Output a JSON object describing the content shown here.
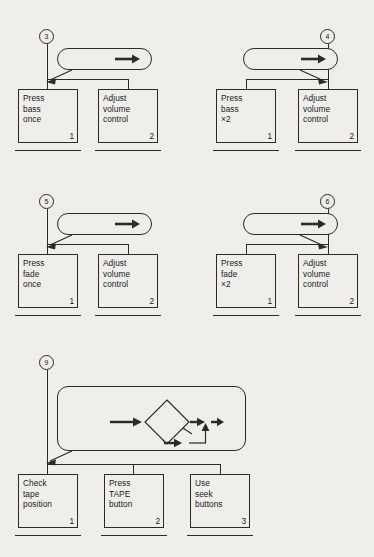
{
  "figure": {
    "notation": "Hierarchical Task Analysis",
    "background_color": "#efeeea",
    "ink_color": "#2a2a2a"
  },
  "diagrams": [
    {
      "id": "diagram-3",
      "marker": "3",
      "plan": {
        "label": "Plan 5.2: 1",
        "arrow": "▶",
        "target": "2"
      },
      "tasks": [
        {
          "text": "Press\nbass\nonce",
          "number": "1"
        },
        {
          "text": "Adjust\nvolume\ncontrol",
          "number": "2"
        }
      ]
    },
    {
      "id": "diagram-4",
      "marker": "4",
      "plan": {
        "label": "Plan 5.3: 1",
        "arrow": "▶",
        "target": "2"
      },
      "tasks": [
        {
          "text": "Press\nbass\n×2",
          "number": "1"
        },
        {
          "text": "Adjust\nvolume\ncontrol",
          "number": "2"
        }
      ]
    },
    {
      "id": "diagram-5",
      "marker": "5",
      "plan": {
        "label": "Plan 5.4: 1",
        "arrow": "▶",
        "target": "2"
      },
      "tasks": [
        {
          "text": "Press\nfade\nonce",
          "number": "1"
        },
        {
          "text": "Adjust\nvolume\ncontrol",
          "number": "2"
        }
      ]
    },
    {
      "id": "diagram-6",
      "marker": "6",
      "plan": {
        "label": "Plan 5.5: 1",
        "arrow": "▶",
        "target": "2"
      },
      "tasks": [
        {
          "text": "Press\nfade\n×2",
          "number": "1"
        },
        {
          "text": "Adjust\nvolume\ncontrol",
          "number": "2"
        }
      ]
    },
    {
      "id": "diagram-9",
      "marker": "9",
      "plan": {
        "entry_label": "Plan 4.2: 1",
        "decision_text": "Auto-\nreverse?",
        "branch_no_label": "N",
        "branch_yes_label": "Y",
        "step_after_no": "3",
        "step_after_yes": "2",
        "exit_label": "EXIT"
      },
      "tasks": [
        {
          "text": "Check\ntape\nposition",
          "number": "1"
        },
        {
          "text": "Press\nTAPE\nbutton",
          "number": "2"
        },
        {
          "text": "Use\nseek\nbuttons",
          "number": "3"
        }
      ]
    }
  ]
}
